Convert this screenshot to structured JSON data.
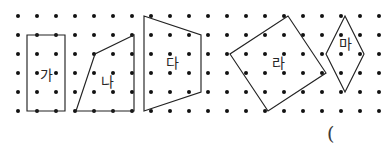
{
  "figure": {
    "background_color": "#ffffff",
    "ink_color": "#232323",
    "dot_color": "#111111",
    "label_color": "#262626",
    "width": 387,
    "height": 155
  },
  "grid": {
    "name": "dot-lattice",
    "columns": 20,
    "rows": 6,
    "origin_x": 18,
    "origin_y": 16,
    "spacing_x": 19,
    "spacing_y": 19,
    "dot_radius": 2.0
  },
  "shapes": [
    {
      "id": "ga",
      "label": "가",
      "kind": "rectangle",
      "label_x": 46,
      "label_y": 76,
      "points": "27,35 65,35 65,111 27,111"
    },
    {
      "id": "na",
      "label": "나",
      "kind": "quadrilateral",
      "label_x": 107,
      "label_y": 83,
      "points": "134,35 95,54 76,111 134,111"
    },
    {
      "id": "da",
      "label": "다",
      "kind": "trapezoid",
      "label_x": 172,
      "label_y": 64,
      "points": "144,16 201,35 201,92 144,111"
    },
    {
      "id": "ra",
      "label": "라",
      "kind": "tilted-rectangle",
      "label_x": 278,
      "label_y": 64,
      "points": "288,16 326,73 268,111 230,54"
    },
    {
      "id": "ma",
      "label": "마",
      "kind": "rhombus",
      "label_x": 345,
      "label_y": 45,
      "points": "345,16 364,54 345,92 326,54"
    }
  ],
  "annotations": {
    "open_paren": "("
  }
}
